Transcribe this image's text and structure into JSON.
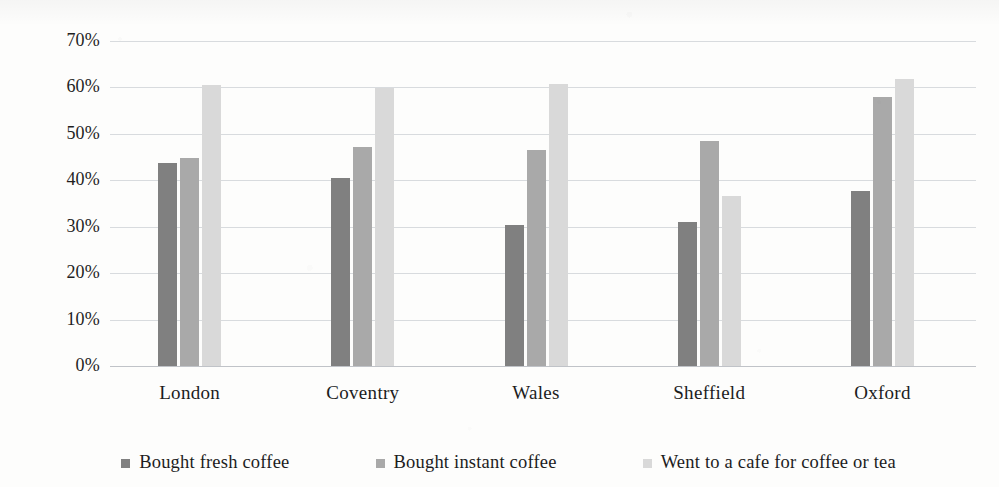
{
  "chart_data": {
    "type": "bar",
    "title": "",
    "subtitle": "",
    "xlabel": "",
    "ylabel": "",
    "ylim": [
      0,
      70
    ],
    "ytick_step": 10,
    "ytick_labels": [
      "0%",
      "10%",
      "20%",
      "30%",
      "40%",
      "50%",
      "60%",
      "70%"
    ],
    "grid": true,
    "grid_axis": "y",
    "legend_position": "bottom",
    "value_format": "percent",
    "categories": [
      "London",
      "Coventry",
      "Wales",
      "Sheffield",
      "Oxford"
    ],
    "series": [
      {
        "name": "Bought fresh coffee",
        "color": "#808080",
        "values": [
          43.7,
          40.6,
          30.3,
          31.0,
          37.8
        ]
      },
      {
        "name": "Bought instant coffee",
        "color": "#a9a9a9",
        "values": [
          44.7,
          47.1,
          46.5,
          48.5,
          58.0
        ]
      },
      {
        "name": "Went to a cafe for coffee or tea",
        "color": "#d9d9d9",
        "values": [
          60.6,
          59.8,
          60.7,
          36.6,
          61.8
        ]
      }
    ]
  },
  "legend": {
    "items": [
      {
        "label": "Bought fresh coffee",
        "color": "#808080",
        "swatch": "square-marker-icon"
      },
      {
        "label": "Bought instant coffee",
        "color": "#a9a9a9",
        "swatch": "square-marker-icon"
      },
      {
        "label": "Went to a cafe for coffee or tea",
        "color": "#d9d9d9",
        "swatch": "square-marker-icon"
      }
    ]
  }
}
